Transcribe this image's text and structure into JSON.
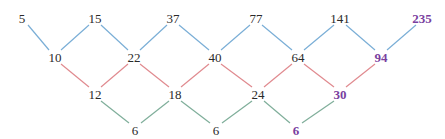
{
  "diagram": {
    "colors": {
      "row1_edges": "#7aaed6",
      "row2_edges": "#e08a8f",
      "row3_edges": "#7fae9a",
      "text": "#2a2a2a",
      "highlight": "#7a3fa0"
    },
    "rows": [
      {
        "name": "sequence",
        "y": 18,
        "values": [
          {
            "label": "5",
            "x": 22
          },
          {
            "label": "15",
            "x": 95
          },
          {
            "label": "37",
            "x": 173
          },
          {
            "label": "77",
            "x": 256
          },
          {
            "label": "141",
            "x": 340
          },
          {
            "label": "235",
            "x": 422,
            "highlight": true
          }
        ]
      },
      {
        "name": "first-differences",
        "y": 57,
        "values": [
          {
            "label": "10",
            "x": 55
          },
          {
            "label": "22",
            "x": 134
          },
          {
            "label": "40",
            "x": 215
          },
          {
            "label": "64",
            "x": 298
          },
          {
            "label": "94",
            "x": 381,
            "highlight": true
          }
        ]
      },
      {
        "name": "second-differences",
        "y": 94,
        "values": [
          {
            "label": "12",
            "x": 95
          },
          {
            "label": "18",
            "x": 175
          },
          {
            "label": "24",
            "x": 258
          },
          {
            "label": "30",
            "x": 340,
            "highlight": true
          }
        ]
      },
      {
        "name": "third-differences",
        "y": 130,
        "values": [
          {
            "label": "6",
            "x": 135
          },
          {
            "label": "6",
            "x": 216
          },
          {
            "label": "6",
            "x": 296,
            "highlight": true
          }
        ]
      }
    ]
  }
}
